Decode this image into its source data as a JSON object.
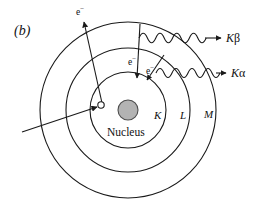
{
  "figure": {
    "panel_label": "(b)",
    "nucleus_label": "Nucleus",
    "nucleus_color": "#b3b3b3",
    "nucleus_stroke": "#1a1a1a",
    "line_color": "#1a1a1a",
    "background": "#ffffff"
  },
  "shells": [
    {
      "name": "K",
      "label": "K",
      "radius": 38
    },
    {
      "name": "L",
      "label": "L",
      "radius": 62
    },
    {
      "name": "M",
      "label": "M",
      "radius": 88
    }
  ],
  "electrons": [
    {
      "id": "ejected-electron",
      "label": "e",
      "charge": "−"
    },
    {
      "id": "transition-electron-m-to-k",
      "label": "e",
      "charge": "−"
    },
    {
      "id": "transition-electron-l-to-k",
      "label": "e",
      "charge": "−"
    }
  ],
  "emissions": [
    {
      "id": "k-beta",
      "k": "K",
      "greek": "β",
      "full": "Kβ"
    },
    {
      "id": "k-alpha",
      "k": "K",
      "greek": "α",
      "full": "Kα"
    }
  ],
  "vacancy": {
    "name": "k-shell-vacancy",
    "cx": 101,
    "cy": 105,
    "r": 3.2
  },
  "center": {
    "cx": 128,
    "cy": 110
  },
  "nucleus": {
    "cx": 128,
    "cy": 110,
    "r": 10
  }
}
